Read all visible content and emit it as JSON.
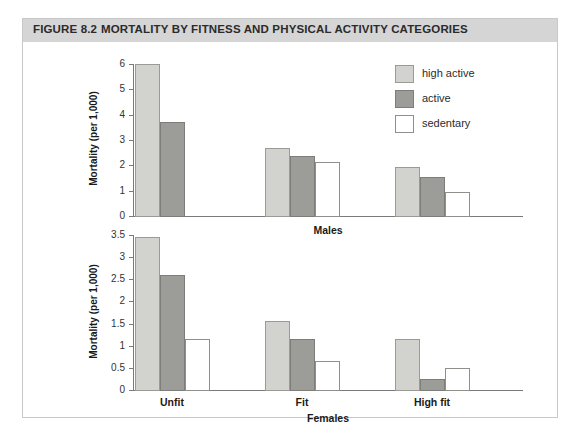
{
  "figure": {
    "number_label": "FIGURE 8.2",
    "title": "MORTALITY BY FITNESS AND PHYSICAL ACTIVITY CATEGORIES"
  },
  "legend": {
    "items": [
      {
        "label": "high active",
        "swatch": "s-high",
        "color": "#d2d2cf"
      },
      {
        "label": "active",
        "swatch": "s-act",
        "color": "#9c9c99"
      },
      {
        "label": "sedentary",
        "swatch": "s-sed",
        "color": "#ffffff"
      }
    ]
  },
  "chart_data": [
    {
      "type": "bar",
      "title": "Males",
      "xlabel": "Males",
      "ylabel": "Mortality (per 1,000)",
      "categories": [
        "Unfit",
        "Fit",
        "High fit"
      ],
      "ylim": [
        0,
        6
      ],
      "yticks": [
        0,
        1,
        2,
        3,
        4,
        5,
        6
      ],
      "ytick_labels": [
        "0",
        "1",
        "2",
        "3",
        "4",
        "5",
        "6"
      ],
      "grid": false,
      "legend_position": "top-right",
      "series": [
        {
          "name": "high active",
          "color": "#d2d2cf",
          "values": [
            6.0,
            2.7,
            1.95
          ]
        },
        {
          "name": "active",
          "color": "#9c9c99",
          "values": [
            3.7,
            2.35,
            1.55
          ]
        },
        {
          "name": "sedentary",
          "color": "#ffffff",
          "values": [
            0.0,
            2.15,
            0.95
          ]
        }
      ]
    },
    {
      "type": "bar",
      "title": "Females",
      "xlabel": "Females",
      "ylabel": "Mortality (per 1,000)",
      "categories": [
        "Unfit",
        "Fit",
        "High fit"
      ],
      "ylim": [
        0,
        3.5
      ],
      "yticks": [
        0,
        0.5,
        1,
        1.5,
        2,
        2.5,
        3,
        3.5
      ],
      "ytick_labels": [
        "0",
        "0.5",
        "1",
        "1.5",
        "2",
        "2.5",
        "3",
        "3.5"
      ],
      "grid": false,
      "legend_position": "none",
      "series": [
        {
          "name": "high active",
          "color": "#d2d2cf",
          "values": [
            3.45,
            1.55,
            1.15
          ]
        },
        {
          "name": "active",
          "color": "#9c9c99",
          "values": [
            2.6,
            1.15,
            0.25
          ]
        },
        {
          "name": "sedentary",
          "color": "#ffffff",
          "values": [
            1.15,
            0.65,
            0.5
          ]
        }
      ]
    }
  ]
}
